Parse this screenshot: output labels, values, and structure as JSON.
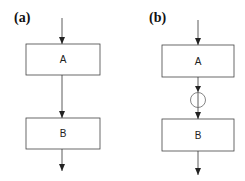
{
  "panels": [
    {
      "label": "(a)",
      "boxes": [
        "A",
        "B"
      ],
      "has_circle": false
    },
    {
      "label": "(b)",
      "boxes": [
        "A",
        "B"
      ],
      "has_circle": true
    }
  ],
  "colors": {
    "stroke": "#333333",
    "box_fill": "#ffffff"
  }
}
